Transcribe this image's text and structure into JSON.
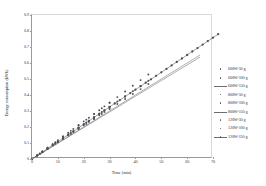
{
  "chart_data": {
    "type": "scatter",
    "title": "",
    "xlabel": "Time (min)",
    "ylabel": "Energy consumption (kWh)",
    "xlim": [
      0,
      70
    ],
    "ylim": [
      0,
      0.9
    ],
    "xticks": [
      "0",
      "10",
      "20",
      "30",
      "40",
      "50",
      "60",
      "70"
    ],
    "yticks": [
      "0",
      "0.1",
      "0.2",
      "0.3",
      "0.4",
      "0.5",
      "0.6",
      "0.7",
      "0.8",
      "0.9"
    ],
    "grid": false,
    "legend_position": "right",
    "series": [
      {
        "name": "600W-50 g",
        "marker": "point",
        "color": "#55565a",
        "x": [
          0,
          2,
          4,
          6,
          8,
          10,
          12,
          14,
          16,
          18,
          20,
          22,
          24,
          26,
          28,
          30
        ],
        "y": [
          0,
          0.022,
          0.044,
          0.065,
          0.087,
          0.109,
          0.131,
          0.152,
          0.174,
          0.196,
          0.218,
          0.239,
          0.261,
          0.283,
          0.305,
          0.326
        ]
      },
      {
        "name": "600W-100 g",
        "marker": "point",
        "color": "#55565a",
        "x": [
          0,
          3,
          6,
          9,
          12,
          15,
          18,
          21,
          24,
          27,
          30,
          33,
          36,
          39,
          42,
          45
        ],
        "y": [
          0,
          0.033,
          0.065,
          0.098,
          0.131,
          0.163,
          0.196,
          0.228,
          0.261,
          0.294,
          0.326,
          0.359,
          0.392,
          0.424,
          0.457,
          0.489
        ]
      },
      {
        "name": "600W-150 g",
        "marker": "line",
        "color": "#6b6c70",
        "x": [
          0,
          5,
          10,
          15,
          20,
          25,
          30,
          35,
          40,
          45,
          50,
          55,
          60,
          65
        ],
        "y": [
          0,
          0.05,
          0.1,
          0.15,
          0.2,
          0.25,
          0.3,
          0.35,
          0.4,
          0.45,
          0.5,
          0.55,
          0.6,
          0.65
        ]
      },
      {
        "name": "800W-50 g",
        "marker": "point",
        "color": "#55565a",
        "x": [
          0,
          2,
          4,
          6,
          8,
          10,
          12,
          14,
          16,
          18,
          20,
          22,
          24,
          26,
          28,
          30
        ],
        "y": [
          0,
          0.021,
          0.042,
          0.063,
          0.084,
          0.105,
          0.126,
          0.147,
          0.168,
          0.189,
          0.21,
          0.231,
          0.252,
          0.273,
          0.294,
          0.315
        ]
      },
      {
        "name": "800W-100 g",
        "marker": "point",
        "color": "#55565a",
        "x": [
          0,
          3,
          6,
          9,
          12,
          15,
          18,
          21,
          24,
          27,
          30,
          33,
          36,
          39,
          42,
          45
        ],
        "y": [
          0,
          0.031,
          0.062,
          0.094,
          0.125,
          0.156,
          0.187,
          0.219,
          0.25,
          0.281,
          0.312,
          0.344,
          0.375,
          0.406,
          0.437,
          0.469
        ]
      },
      {
        "name": "800W-150 g",
        "marker": "line",
        "color": "#6b6c70",
        "x": [
          0,
          5,
          10,
          15,
          20,
          25,
          30,
          35,
          40,
          45,
          50,
          55,
          60,
          65
        ],
        "y": [
          0,
          0.049,
          0.098,
          0.147,
          0.196,
          0.245,
          0.294,
          0.343,
          0.392,
          0.441,
          0.49,
          0.539,
          0.588,
          0.637
        ]
      },
      {
        "name": "120W-50 g",
        "marker": "point",
        "color": "#4e4f55",
        "x": [
          0,
          2,
          4,
          6,
          8,
          10,
          12,
          14,
          16,
          18,
          20,
          22,
          24,
          26,
          28,
          30
        ],
        "y": [
          0,
          0.024,
          0.048,
          0.07,
          0.094,
          0.117,
          0.141,
          0.164,
          0.188,
          0.211,
          0.235,
          0.258,
          0.282,
          0.305,
          0.329,
          0.352
        ]
      },
      {
        "name": "120W-100 g",
        "marker": "point",
        "color": "#4e4f55",
        "x": [
          0,
          3,
          6,
          9,
          12,
          15,
          18,
          21,
          24,
          27,
          30,
          33,
          36,
          39,
          42,
          45
        ],
        "y": [
          0,
          0.035,
          0.07,
          0.105,
          0.141,
          0.176,
          0.211,
          0.246,
          0.282,
          0.317,
          0.352,
          0.387,
          0.422,
          0.458,
          0.493,
          0.528
        ]
      },
      {
        "name": "120W-150 g",
        "marker": "line-point",
        "color": "#4e4f55",
        "x": [
          0,
          2,
          4,
          6,
          8,
          10,
          12,
          14,
          16,
          18,
          20,
          22,
          24,
          26,
          28,
          30,
          32,
          34,
          36,
          38,
          40,
          42,
          44,
          46,
          48,
          50,
          52,
          54,
          56,
          58,
          60,
          62,
          64,
          66,
          68,
          70,
          72
        ],
        "y": [
          0,
          0.022,
          0.043,
          0.065,
          0.087,
          0.108,
          0.13,
          0.152,
          0.173,
          0.195,
          0.217,
          0.238,
          0.26,
          0.282,
          0.303,
          0.325,
          0.347,
          0.368,
          0.39,
          0.412,
          0.433,
          0.455,
          0.477,
          0.498,
          0.52,
          0.542,
          0.563,
          0.585,
          0.607,
          0.628,
          0.65,
          0.672,
          0.693,
          0.715,
          0.737,
          0.758,
          0.78
        ]
      }
    ]
  },
  "legend": {
    "entries": [
      {
        "label": "600W-50 g",
        "marker": "point"
      },
      {
        "label": "600W-100 g",
        "marker": "point"
      },
      {
        "label": "600W-150 g",
        "marker": "line"
      },
      {
        "label": "800W-50 g",
        "marker": "point"
      },
      {
        "label": "800W-100 g",
        "marker": "point"
      },
      {
        "label": "800W-150 g",
        "marker": "line"
      },
      {
        "label": "120W-50 g",
        "marker": "point"
      },
      {
        "label": "120W-100 g",
        "marker": "point"
      },
      {
        "label": "120W-150 g",
        "marker": "line-point"
      }
    ]
  }
}
